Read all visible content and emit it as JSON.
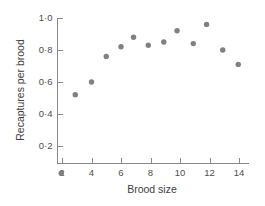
{
  "chart_data": {
    "type": "scatter",
    "title": "",
    "xlabel": "Brood size",
    "ylabel": "Recaptures per brood",
    "x": [
      2,
      3,
      4,
      5,
      6,
      7,
      8,
      9,
      10,
      11,
      12,
      14
    ],
    "values": [
      0.03,
      0.52,
      0.6,
      0.76,
      0.82,
      0.88,
      0.83,
      0.85,
      0.92,
      0.84,
      0.96,
      0.71
    ],
    "points": [
      {
        "x": 1.95,
        "y": 0.03
      },
      {
        "x": 2.9,
        "y": 0.52
      },
      {
        "x": 4.0,
        "y": 0.6
      },
      {
        "x": 5.0,
        "y": 0.76
      },
      {
        "x": 6.0,
        "y": 0.82
      },
      {
        "x": 6.85,
        "y": 0.88
      },
      {
        "x": 7.85,
        "y": 0.83
      },
      {
        "x": 8.9,
        "y": 0.85
      },
      {
        "x": 9.8,
        "y": 0.92
      },
      {
        "x": 10.9,
        "y": 0.84
      },
      {
        "x": 11.8,
        "y": 0.96
      },
      {
        "x": 12.9,
        "y": 0.8
      },
      {
        "x": 13.95,
        "y": 0.71
      }
    ],
    "xlim": [
      1.3,
      14.8
    ],
    "ylim": [
      0.0,
      1.04
    ],
    "xticks": [
      2,
      4,
      6,
      8,
      10,
      12,
      14
    ],
    "xtick_labels": [
      "2",
      "4",
      "6",
      "8",
      "10",
      "12",
      "14"
    ],
    "yticks": [
      0.2,
      0.4,
      0.6,
      0.8,
      1.0
    ],
    "ytick_labels": [
      "0·2",
      "0·4",
      "0·6",
      "0·8",
      "1·0"
    ],
    "grid": false,
    "legend": null,
    "marker_color": "#808080",
    "axis_color": "#8a8a8a",
    "text_color": "#4d4d4d"
  }
}
